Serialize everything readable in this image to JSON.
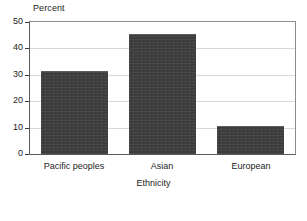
{
  "chart_data": {
    "type": "bar",
    "title": "",
    "subtitle": "",
    "xlabel": "Ethnicity",
    "ylabel": "Percent",
    "categories": [
      "Pacific peoples",
      "Asian",
      "European"
    ],
    "values": [
      31.5,
      45.5,
      10.5
    ],
    "ylim": [
      0,
      50
    ],
    "yticks": [
      0,
      10,
      20,
      30,
      40,
      50
    ],
    "ytick_labels": [
      "0",
      "10",
      "20",
      "30",
      "40",
      "50"
    ],
    "grid": true,
    "grid_axis": "y",
    "legend": false,
    "legend_position": "none",
    "series": [
      {
        "name": "Percent",
        "values": [
          31.5,
          45.5,
          10.5
        ],
        "color": "#3b3b3b"
      }
    ],
    "annotations": []
  },
  "axes": {
    "y_unit_caption": "Percent",
    "x_axis_title": "Ethnicity"
  },
  "colors": {
    "bar_fill": "#3b3b3b",
    "bar_edge": "#5e5e5e",
    "gridline": "#d8d8d8",
    "axis_line": "#5a5a5a",
    "frame_line": "#8c8c8c",
    "background": "#ffffff",
    "text": "#1c1c1c"
  }
}
